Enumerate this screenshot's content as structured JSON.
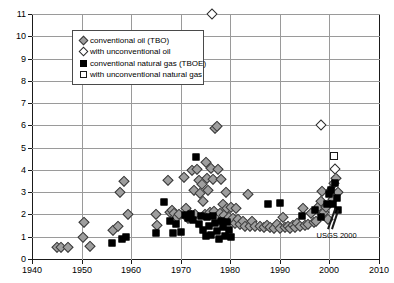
{
  "chart_data": {
    "type": "scatter",
    "title": "",
    "xlabel": "",
    "ylabel": "",
    "xlim": [
      1940,
      2010
    ],
    "ylim": [
      0,
      11
    ],
    "xticks": [
      1940,
      1950,
      1960,
      1970,
      1980,
      1990,
      2000,
      2010
    ],
    "yticks": [
      0,
      1,
      2,
      3,
      4,
      5,
      6,
      7,
      8,
      9,
      10,
      11
    ],
    "grid": true,
    "legend_position": "upper-left-inside",
    "annotations": [
      {
        "text": "USGS 2000",
        "x": 1997.0,
        "y": 1.05
      }
    ],
    "series": [
      {
        "name": "conventional oil (TBO)",
        "marker": "diamond",
        "fill": "#9e9e9e",
        "edge": "#3a3a3a",
        "points": [
          [
            1945.0,
            0.52
          ],
          [
            1945.8,
            0.52
          ],
          [
            1947.2,
            0.56
          ],
          [
            1950.2,
            1.0
          ],
          [
            1950.4,
            1.65
          ],
          [
            1951.6,
            0.6
          ],
          [
            1956.4,
            1.3
          ],
          [
            1957.4,
            1.48
          ],
          [
            1957.8,
            3.02
          ],
          [
            1958.6,
            3.5
          ],
          [
            1959.4,
            2.02
          ],
          [
            1965.0,
            2.02
          ],
          [
            1965.2,
            1.52
          ],
          [
            1967.4,
            3.55
          ],
          [
            1967.8,
            2.1
          ],
          [
            1968.2,
            2.18
          ],
          [
            1968.6,
            2.05
          ],
          [
            1969.2,
            1.88
          ],
          [
            1969.6,
            2.0
          ],
          [
            1970.6,
            3.66
          ],
          [
            1971.0,
            2.28
          ],
          [
            1971.4,
            1.84
          ],
          [
            1971.8,
            2.02
          ],
          [
            1972.2,
            4.0
          ],
          [
            1972.6,
            3.1
          ],
          [
            1972.9,
            2.0
          ],
          [
            1973.2,
            4.05
          ],
          [
            1973.6,
            3.55
          ],
          [
            1973.9,
            2.95
          ],
          [
            1974.2,
            3.35
          ],
          [
            1974.5,
            2.6
          ],
          [
            1974.8,
            2.02
          ],
          [
            1975.0,
            4.35
          ],
          [
            1975.3,
            3.62
          ],
          [
            1975.6,
            3.1
          ],
          [
            1975.9,
            2.12
          ],
          [
            1976.2,
            4.1
          ],
          [
            1976.5,
            3.58
          ],
          [
            1976.8,
            2.15
          ],
          [
            1977.0,
            5.9
          ],
          [
            1977.3,
            5.98
          ],
          [
            1977.6,
            4.02
          ],
          [
            1977.9,
            2.05
          ],
          [
            1978.2,
            3.6
          ],
          [
            1978.5,
            2.48
          ],
          [
            1978.8,
            1.96
          ],
          [
            1979.1,
            3.02
          ],
          [
            1979.4,
            2.3
          ],
          [
            1979.7,
            1.9
          ],
          [
            1980.2,
            2.35
          ],
          [
            1980.6,
            1.85
          ],
          [
            1980.9,
            1.62
          ],
          [
            1981.2,
            2.3
          ],
          [
            1981.6,
            1.8
          ],
          [
            1982.0,
            1.58
          ],
          [
            1982.6,
            1.7
          ],
          [
            1983.0,
            1.5
          ],
          [
            1983.5,
            2.9
          ],
          [
            1984.0,
            1.48
          ],
          [
            1984.4,
            1.7
          ],
          [
            1985.0,
            1.46
          ],
          [
            1986.0,
            1.5
          ],
          [
            1986.8,
            1.42
          ],
          [
            1987.4,
            1.52
          ],
          [
            1988.0,
            1.44
          ],
          [
            1988.8,
            1.4
          ],
          [
            1989.4,
            1.56
          ],
          [
            1990.0,
            1.38
          ],
          [
            1990.6,
            1.9
          ],
          [
            1991.0,
            1.42
          ],
          [
            1991.6,
            1.48
          ],
          [
            1992.0,
            1.4
          ],
          [
            1992.6,
            1.52
          ],
          [
            1993.0,
            1.44
          ],
          [
            1993.5,
            1.62
          ],
          [
            1994.0,
            1.46
          ],
          [
            1994.6,
            2.28
          ],
          [
            1995.0,
            1.52
          ],
          [
            1995.6,
            1.58
          ],
          [
            1996.2,
            2.05
          ],
          [
            1996.8,
            1.64
          ],
          [
            1997.2,
            1.7
          ],
          [
            1997.8,
            2.4
          ],
          [
            1998.2,
            2.62
          ],
          [
            1998.6,
            3.05
          ],
          [
            1999.0,
            2.1
          ],
          [
            1999.4,
            2.35
          ],
          [
            1999.8,
            1.8
          ],
          [
            2000.3,
            3.08
          ],
          [
            2000.7,
            2.7
          ],
          [
            2001.0,
            3.4
          ],
          [
            2001.4,
            3.62
          ],
          [
            2001.8,
            3.02
          ]
        ]
      },
      {
        "name": "with unconventional oil",
        "marker": "diamond",
        "fill": "#ffffff",
        "edge": "#2a2a2a",
        "points": [
          [
            1976.3,
            11.0
          ],
          [
            1998.2,
            6.0
          ],
          [
            2001.2,
            4.02
          ]
        ]
      },
      {
        "name": "conventional natural gas (TBOE)",
        "marker": "square",
        "fill": "#000000",
        "edge": "#000000",
        "points": [
          [
            1956.2,
            0.7
          ],
          [
            1958.2,
            0.92
          ],
          [
            1958.9,
            1.0
          ],
          [
            1965.0,
            1.18
          ],
          [
            1966.6,
            2.58
          ],
          [
            1967.8,
            1.72
          ],
          [
            1968.4,
            1.16
          ],
          [
            1969.0,
            1.58
          ],
          [
            1970.0,
            1.22
          ],
          [
            1970.8,
            1.98
          ],
          [
            1971.4,
            1.86
          ],
          [
            1972.0,
            2.02
          ],
          [
            1972.5,
            1.74
          ],
          [
            1973.0,
            4.6
          ],
          [
            1973.6,
            1.58
          ],
          [
            1974.0,
            1.92
          ],
          [
            1974.5,
            1.3
          ],
          [
            1975.0,
            1.05
          ],
          [
            1975.4,
            1.88
          ],
          [
            1975.8,
            1.5
          ],
          [
            1976.2,
            1.1
          ],
          [
            1976.6,
            1.94
          ],
          [
            1977.0,
            1.62
          ],
          [
            1977.4,
            1.24
          ],
          [
            1977.8,
            0.92
          ],
          [
            1978.2,
            1.72
          ],
          [
            1978.6,
            1.44
          ],
          [
            1979.0,
            1.02
          ],
          [
            1979.4,
            1.66
          ],
          [
            1979.8,
            1.3
          ],
          [
            1980.2,
            0.98
          ],
          [
            1987.6,
            2.45
          ],
          [
            1990.0,
            2.52
          ],
          [
            1994.4,
            1.92
          ],
          [
            1997.0,
            2.2
          ],
          [
            1998.4,
            1.9
          ],
          [
            1999.6,
            2.48
          ],
          [
            2000.0,
            2.9
          ],
          [
            2000.4,
            3.12
          ],
          [
            2000.8,
            2.48
          ],
          [
            2001.2,
            3.4
          ],
          [
            2001.5,
            2.72
          ],
          [
            2001.8,
            2.2
          ]
        ]
      },
      {
        "name": "with unconventional natural gas",
        "marker": "square",
        "fill": "#ffffff",
        "edge": "#1a1a1a",
        "points": [
          [
            2001.0,
            4.62
          ]
        ]
      }
    ]
  },
  "legend": {
    "entries": [
      {
        "label": "conventional oil (TBO)",
        "marker": "gray-diamond"
      },
      {
        "label": "with unconventional oil",
        "marker": "white-diamond"
      },
      {
        "label": "conventional natural gas (TBOE)",
        "marker": "black-square"
      },
      {
        "label": "with unconventional natural gas",
        "marker": "white-square"
      }
    ]
  },
  "axes": {
    "x_tick_labels": [
      "1940",
      "1950",
      "1960",
      "1970",
      "1980",
      "1990",
      "2000",
      "2010"
    ],
    "y_tick_labels": [
      "0",
      "1",
      "2",
      "3",
      "4",
      "5",
      "6",
      "7",
      "8",
      "9",
      "10",
      "11"
    ]
  },
  "annotation": {
    "usgs_label": "USGS 2000"
  }
}
